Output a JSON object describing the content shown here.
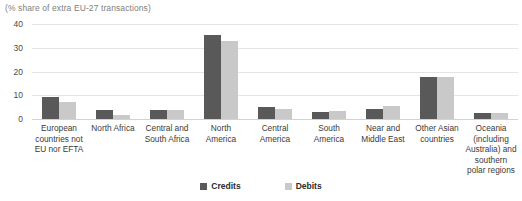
{
  "chart_data": {
    "type": "bar",
    "title": "",
    "subtitle": "(% share of extra EU-27 transactions)",
    "xlabel": "",
    "ylabel": "",
    "ylim": [
      0,
      40
    ],
    "yticks": [
      40,
      30,
      20,
      10,
      0
    ],
    "grid": true,
    "legend_position": "bottom",
    "categories": [
      "European countries not EU nor EFTA",
      "North Africa",
      "Central and South Africa",
      "North America",
      "Central America",
      "South America",
      "Near and Middle East",
      "Other Asian countries",
      "Oceania (including Australia) and southern polar regions"
    ],
    "series": [
      {
        "name": "Credits",
        "color": "#595959",
        "values": [
          9.2,
          3.7,
          3.9,
          35.2,
          5.2,
          3.0,
          4.3,
          17.7,
          2.4
        ]
      },
      {
        "name": "Debits",
        "color": "#c9c9c9",
        "values": [
          7.2,
          1.5,
          4.0,
          33.0,
          4.1,
          3.4,
          5.5,
          17.8,
          2.5
        ]
      }
    ]
  },
  "legend": {
    "items": [
      {
        "label": "Credits",
        "color": "#595959"
      },
      {
        "label": "Debits",
        "color": "#c9c9c9"
      }
    ]
  }
}
